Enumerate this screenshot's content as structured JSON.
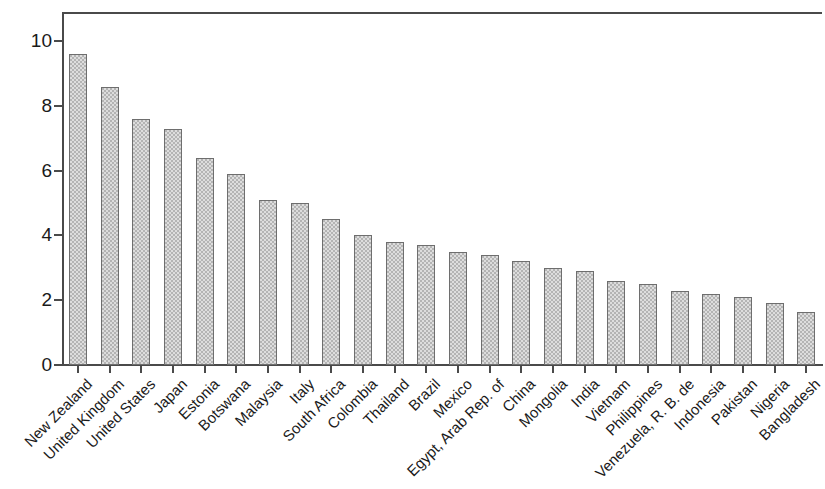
{
  "chart_data": {
    "type": "bar",
    "title": "",
    "subtitle": "",
    "xlabel": "",
    "ylabel": "",
    "grid": false,
    "legend": null,
    "legend_position": "none",
    "ylim": [
      0,
      10.9
    ],
    "ytick_values": [
      0,
      2,
      4,
      6,
      8,
      10
    ],
    "ytick_labels": [
      "0",
      "2",
      "4",
      "6",
      "8",
      "10"
    ],
    "bar_fill_color": "#b4b4b4",
    "bar_edge_color": "#6e6e6e",
    "axis_color": "#4a4a4a",
    "background_color": "#ffffff",
    "label_rotation_degrees": 45,
    "categories": [
      "New Zealand",
      "United Kingdom",
      "United States",
      "Japan",
      "Estonia",
      "Botswana",
      "Malaysia",
      "Italy",
      "South Africa",
      "Colombia",
      "Thailand",
      "Brazil",
      "Mexico",
      "Egypt, Arab Rep. of",
      "China",
      "Mongolia",
      "India",
      "Vietnam",
      "Philippines",
      "Venezuela, R. B. de",
      "Indonesia",
      "Pakistan",
      "Nigeria",
      "Bangladesh"
    ],
    "values": [
      9.6,
      8.6,
      7.6,
      7.3,
      6.4,
      5.9,
      5.1,
      5.0,
      4.5,
      4.0,
      3.8,
      3.7,
      3.5,
      3.4,
      3.2,
      3.0,
      2.9,
      2.6,
      2.5,
      2.3,
      2.2,
      2.1,
      1.9,
      1.65
    ]
  }
}
